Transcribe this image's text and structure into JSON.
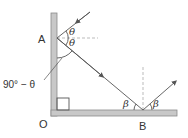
{
  "diagram": {
    "points": {
      "A": "A",
      "O": "O",
      "B": "B"
    },
    "angles": {
      "theta_upper": "θ",
      "theta_lower": "θ",
      "complement": "90° − θ",
      "beta_left": "β",
      "beta_right": "β"
    },
    "colors": {
      "mirror_fill": "#c8c8c8",
      "mirror_edge": "#8a8a8a",
      "ray": "#555555",
      "normal_dash": "#aaaaaa",
      "text": "#333333"
    }
  }
}
